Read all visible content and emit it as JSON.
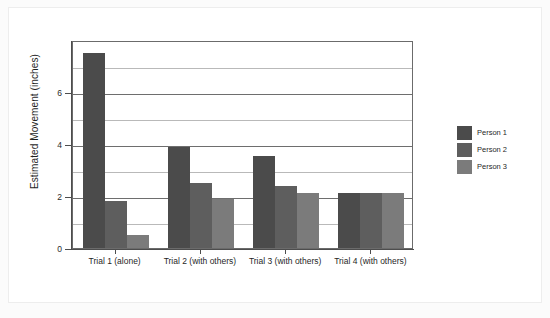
{
  "chart_data": {
    "type": "bar",
    "title": "",
    "xlabel": "",
    "ylabel": "Estimated Movement (inches)",
    "categories": [
      "Trial 1 (alone)",
      "Trial 2 (with others)",
      "Trial 3 (with others)",
      "Trial 4 (with others)"
    ],
    "series": [
      {
        "name": "Person 1",
        "color": "#4b4b4b",
        "values": [
          7.5,
          3.9,
          3.55,
          2.1
        ]
      },
      {
        "name": "Person 2",
        "color": "#5e5e5e",
        "values": [
          1.8,
          2.5,
          2.4,
          2.1
        ]
      },
      {
        "name": "Person 3",
        "color": "#7b7b7b",
        "values": [
          0.5,
          1.9,
          2.1,
          2.1
        ]
      }
    ],
    "ylim": [
      0,
      8
    ],
    "y_ticks": [
      0,
      2,
      4,
      6
    ],
    "y_tick_labels": [
      "0",
      "2",
      "4",
      "6"
    ],
    "gridlines": [
      1,
      2,
      3,
      4,
      5,
      6,
      7
    ],
    "grid": true,
    "legend_position": "right",
    "legend_entries": [
      "Person 1",
      "Person 2",
      "Person 3"
    ]
  },
  "colors": {
    "background": "#fbfbfb",
    "plot_background": "#ffffff",
    "axis": "#4d4d4d",
    "gridline": "#b9b9b9",
    "gridline_major": "#6e6e6e",
    "text": "#1f1f1f"
  }
}
